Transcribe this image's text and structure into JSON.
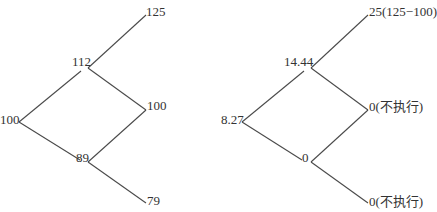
{
  "colors": {
    "line": "#4a4a4a",
    "text": "#333333",
    "background": "#ffffff"
  },
  "stock_tree": {
    "root": "100",
    "up": "112",
    "down": "89",
    "up_up": "125",
    "up_down": "100",
    "down_down": "79"
  },
  "option_tree": {
    "root": "8.27",
    "up": "14.44",
    "down": "0",
    "up_up": "25(125−100)",
    "up_down": "0(不执行)",
    "down_down": "0(不执行)"
  }
}
